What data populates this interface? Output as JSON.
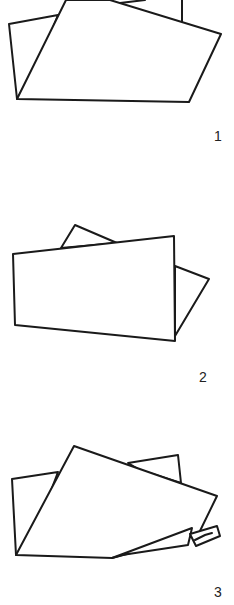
{
  "figures": [
    {
      "label": "1",
      "description": "Folded sheets, step 1"
    },
    {
      "label": "2",
      "description": "Folded sheets, step 2"
    },
    {
      "label": "3",
      "description": "Folded sheets, step 3 with fold clipped at corner"
    }
  ],
  "colors": {
    "stroke": "#1a1a1a",
    "background": "#ffffff"
  }
}
